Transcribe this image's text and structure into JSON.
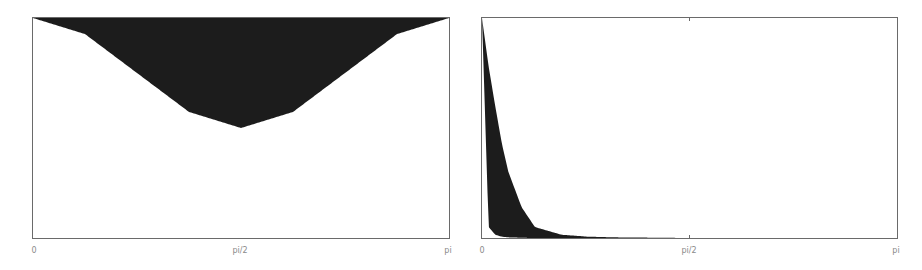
{
  "chart_data": [
    {
      "type": "area",
      "title": "",
      "xlabel": "",
      "ylabel": "",
      "xlim": [
        0,
        3.14159
      ],
      "ylim": [
        0,
        1
      ],
      "grid": false,
      "legend": null,
      "x_ticks": [
        0,
        1.5708,
        3.14159
      ],
      "x_tick_labels": [
        "0",
        "pi/2",
        "pi"
      ],
      "fill_color": "#1c1c1c",
      "description": "Filled band between upper bound y=1 and lower bound y=1-0.5*sin^2(x)",
      "x": [
        0,
        0.3927,
        0.7854,
        1.1781,
        1.5708,
        1.9635,
        2.3562,
        2.7489,
        3.14159
      ],
      "series": [
        {
          "name": "upper",
          "values": [
            1,
            1,
            1,
            1,
            1,
            1,
            1,
            1,
            1
          ]
        },
        {
          "name": "lower",
          "values": [
            1.0,
            0.927,
            0.75,
            0.573,
            0.5,
            0.573,
            0.75,
            0.927,
            1.0
          ]
        }
      ]
    },
    {
      "type": "area",
      "title": "",
      "xlabel": "",
      "ylabel": "",
      "xlim": [
        0,
        3.14159
      ],
      "ylim": [
        0,
        1
      ],
      "grid": false,
      "legend": null,
      "x_ticks": [
        0,
        1.5708,
        3.14159
      ],
      "x_tick_labels": [
        "0",
        "pi/2",
        "pi"
      ],
      "fill_color": "#1c1c1c",
      "description": "Filled band between two rapidly decaying curves starting at 1 at x=0",
      "x": [
        0,
        0.05,
        0.1,
        0.15,
        0.2,
        0.3,
        0.4,
        0.6,
        0.8,
        1.0,
        1.5708,
        3.14159
      ],
      "series": [
        {
          "name": "outer",
          "values": [
            1.0,
            0.78,
            0.6,
            0.43,
            0.3,
            0.14,
            0.05,
            0.015,
            0.006,
            0.003,
            0.0,
            0.0
          ]
        },
        {
          "name": "inner",
          "values": [
            1.0,
            0.05,
            0.015,
            0.006,
            0.003,
            0.001,
            0.0,
            0.0,
            0.0,
            0.0,
            0.0,
            0.0
          ]
        }
      ]
    }
  ]
}
